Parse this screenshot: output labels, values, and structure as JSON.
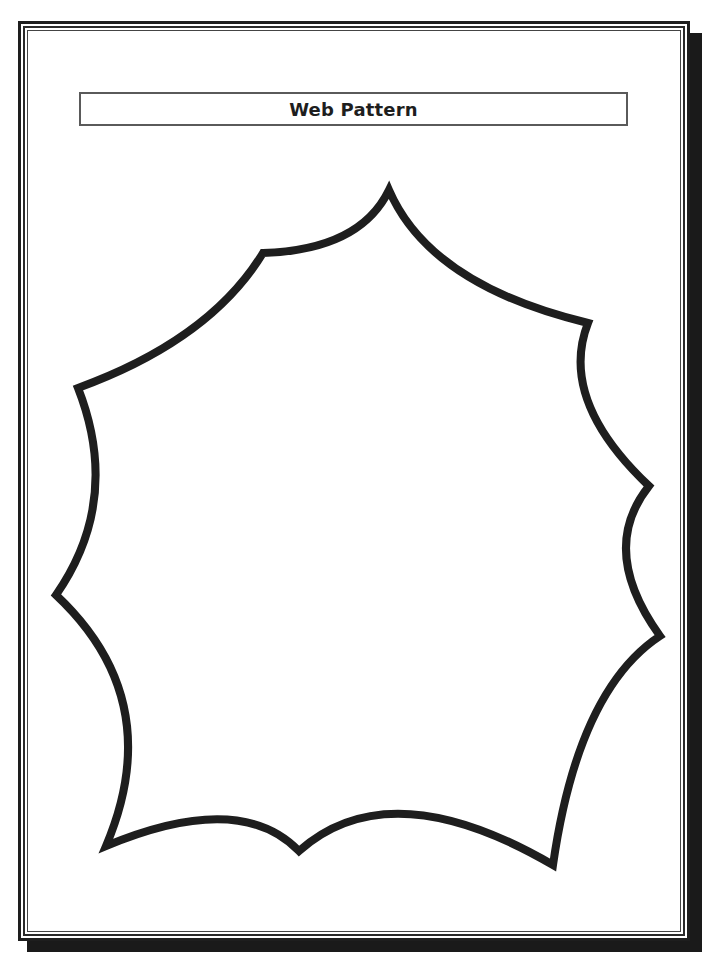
{
  "page": {
    "title": "Web Pattern"
  },
  "frame": {
    "style": "triple-line border with drop shadow",
    "line_color": "#1e1e1e",
    "shadow_color": "#1a1a1a"
  },
  "shape": {
    "name": "web-pattern-outline",
    "stroke_color": "#1e1e1e",
    "stroke_width": 8,
    "vertices": [
      [
        389,
        190
      ],
      [
        588,
        323
      ],
      [
        649,
        486
      ],
      [
        660,
        636
      ],
      [
        553,
        865
      ],
      [
        299,
        851
      ],
      [
        106,
        846
      ],
      [
        56,
        595
      ],
      [
        78,
        388
      ],
      [
        263,
        253
      ]
    ]
  }
}
